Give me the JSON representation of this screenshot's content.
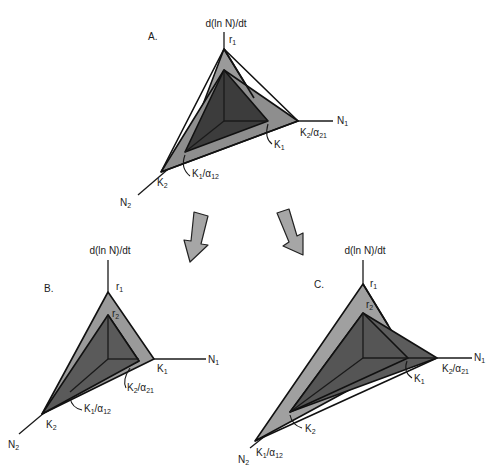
{
  "figure": {
    "colors": {
      "light_fill": "#9a9a9a",
      "dark_fill": "#3c3c3c",
      "mid_fill": "#5c5c5c",
      "edge": "#111111",
      "arrow_fill": "#a6a6a6"
    }
  },
  "panels": [
    {
      "id": "A",
      "label": "A.",
      "y_axis_label": "d(ln N)/dt",
      "x_axis_label": "N",
      "x_axis_sub": "1",
      "z_axis_label": "N",
      "z_axis_sub": "2",
      "r1": {
        "base": "r",
        "sub": "1"
      },
      "r2": {
        "base": "r",
        "sub": "2"
      },
      "K1": {
        "base": "K",
        "sub": "1"
      },
      "K2": {
        "base": "K",
        "sub": "2"
      },
      "K2_a21": {
        "base": "K",
        "sub1": "2",
        "mid": "/α",
        "sub2": "21"
      },
      "K1_a12": {
        "base": "K",
        "sub1": "1",
        "mid": "/α",
        "sub2": "12"
      }
    },
    {
      "id": "B",
      "label": "B.",
      "y_axis_label": "d(ln N)/dt",
      "x_axis_label": "N",
      "x_axis_sub": "1",
      "z_axis_label": "N",
      "z_axis_sub": "2",
      "r1": {
        "base": "r",
        "sub": "1"
      },
      "r2": {
        "base": "r",
        "sub": "2"
      },
      "K1": {
        "base": "K",
        "sub": "1"
      },
      "K2": {
        "base": "K",
        "sub": "2"
      },
      "K2_a21": {
        "base": "K",
        "sub1": "2",
        "mid": "/α",
        "sub2": "21"
      },
      "K1_a12": {
        "base": "K",
        "sub1": "1",
        "mid": "/α",
        "sub2": "12"
      }
    },
    {
      "id": "C",
      "label": "C.",
      "y_axis_label": "d(ln N)/dt",
      "x_axis_label": "N",
      "x_axis_sub": "1",
      "z_axis_label": "N",
      "z_axis_sub": "2",
      "r1": {
        "base": "r",
        "sub": "1"
      },
      "r2": {
        "base": "r",
        "sub": "2"
      },
      "K1": {
        "base": "K",
        "sub": "1"
      },
      "K2": {
        "base": "K",
        "sub": "2"
      },
      "K2_a21": {
        "base": "K",
        "sub1": "2",
        "mid": "/α",
        "sub2": "21"
      },
      "K1_a12": {
        "base": "K",
        "sub1": "1",
        "mid": "/α",
        "sub2": "12"
      }
    }
  ],
  "arrows": [
    {
      "from": "A",
      "to": "B"
    },
    {
      "from": "A",
      "to": "C"
    }
  ]
}
